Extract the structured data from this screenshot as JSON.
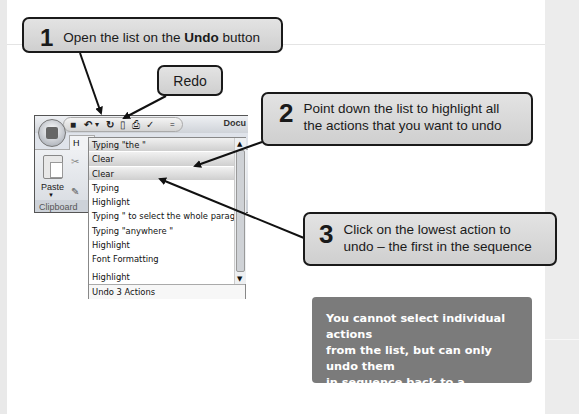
{
  "callouts": {
    "step1": {
      "number": "1",
      "text_before": "Open the list on the ",
      "text_bold": "Undo",
      "text_after": " button"
    },
    "redo": {
      "label": "Redo"
    },
    "step2": {
      "number": "2",
      "line1": "Point down the list to highlight all",
      "line2": "the actions that you want to undo"
    },
    "step3": {
      "number": "3",
      "line1": "Click on the lowest action to",
      "line2": "undo – the first in the sequence"
    }
  },
  "info_box": {
    "line1": "You cannot select individual actions",
    "line2": "from the list, but can only undo them",
    "line3": "in sequence back to a selected point."
  },
  "word_window": {
    "doc_title": "Docu",
    "tab_home": "H",
    "paste_label": "Paste",
    "group_label": "Clipboard",
    "qat": {
      "save_icon": "■",
      "undo_icon": "↶",
      "undo_dropdown": "▾",
      "redo_icon": "↻",
      "new_icon": "▯",
      "print_icon": "⎙",
      "spell_icon": "✓",
      "customize": "="
    }
  },
  "undo_list": {
    "items": [
      {
        "label": "Typing \"the \"",
        "selected": true
      },
      {
        "label": "Clear",
        "selected": true
      },
      {
        "label": "Clear",
        "selected": true
      },
      {
        "label": "Typing",
        "selected": false
      },
      {
        "label": "Highlight",
        "selected": false
      },
      {
        "label": "Typing \" to select the whole paragraph\"",
        "selected": false
      },
      {
        "label": "Typing \"anywhere \"",
        "selected": false
      },
      {
        "label": "Highlight",
        "selected": false
      },
      {
        "label": "Font Formatting",
        "selected": false
      },
      {
        "label": "Highlight",
        "selected": false
      }
    ],
    "footer": "Undo 3 Actions",
    "scroll_up": "▲",
    "scroll_down": "▼"
  },
  "colors": {
    "callout_bg": "#d9d9d9",
    "callout_border": "#1a1a1a",
    "info_bg": "#7b7b7b",
    "info_text": "#ffffff",
    "selected_item": "#dcdcdc"
  }
}
